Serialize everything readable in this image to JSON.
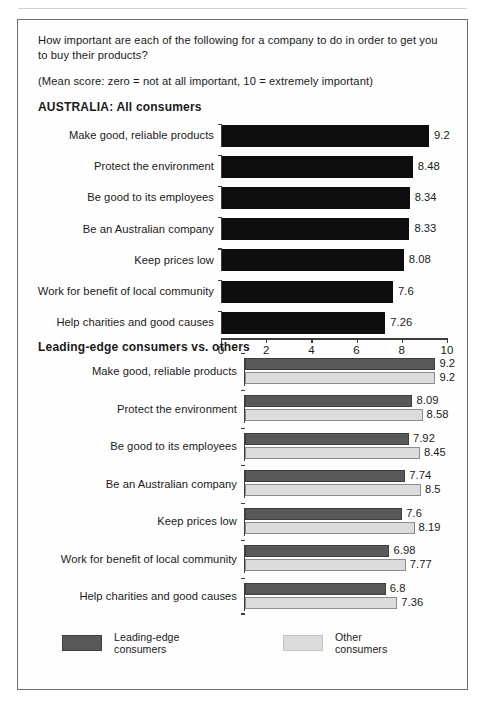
{
  "figure": {
    "question": "How important are each of the following for a company to do in order to get you to buy their products?",
    "scale_note": "(Mean score: zero = not at all important, 10 = extremely important)",
    "section_one_title": "AUSTRALIA: All consumers",
    "section_two_title": "Leading-edge consumers vs. others"
  },
  "legend": {
    "items": [
      {
        "label": "Leading-edge consumers",
        "color": "#595959"
      },
      {
        "label": "Other consumers",
        "color": "#dcdcdc"
      }
    ]
  },
  "chart_data": [
    {
      "type": "bar",
      "title": "AUSTRALIA: All consumers",
      "orientation": "horizontal",
      "xlabel": "",
      "ylabel": "",
      "xlim": [
        0,
        10
      ],
      "xticks": [
        "0",
        "2",
        "4",
        "6",
        "8",
        "10"
      ],
      "xtick_values": [
        0,
        2,
        4,
        6,
        8,
        10
      ],
      "grid": false,
      "bar_color": "#0d0d0d",
      "categories": [
        "Make good, reliable products",
        "Protect the environment",
        "Be good to its employees",
        "Be an Australian company",
        "Keep prices low",
        "Work for benefit of local community",
        "Help charities and good causes"
      ],
      "values": [
        9.2,
        8.48,
        8.34,
        8.33,
        8.08,
        7.6,
        7.26
      ],
      "value_labels": [
        "9.2",
        "8.48",
        "8.34",
        "8.33",
        "8.08",
        "7.6",
        "7.26"
      ]
    },
    {
      "type": "bar",
      "title": "Leading-edge consumers vs. others",
      "orientation": "horizontal",
      "xlabel": "",
      "ylabel": "",
      "xlim": [
        0,
        10
      ],
      "grid": false,
      "legend_position": "bottom",
      "categories": [
        "Make good, reliable products",
        "Protect the environment",
        "Be good to its employees",
        "Be an Australian company",
        "Keep prices low",
        "Work for benefit of local community",
        "Help charities and good causes"
      ],
      "series": [
        {
          "name": "Leading-edge consumers",
          "color": "#595959",
          "values": [
            9.2,
            8.09,
            7.92,
            7.74,
            7.6,
            6.98,
            6.8
          ],
          "value_labels": [
            "9.2",
            "8.09",
            "7.92",
            "7.74",
            "7.6",
            "6.98",
            "6.8"
          ]
        },
        {
          "name": "Other consumers",
          "color": "#dcdcdc",
          "values": [
            9.2,
            8.58,
            8.45,
            8.5,
            8.19,
            7.77,
            7.36
          ],
          "value_labels": [
            "9.2",
            "8.58",
            "8.45",
            "8.5",
            "8.19",
            "7.77",
            "7.36"
          ]
        }
      ]
    }
  ]
}
